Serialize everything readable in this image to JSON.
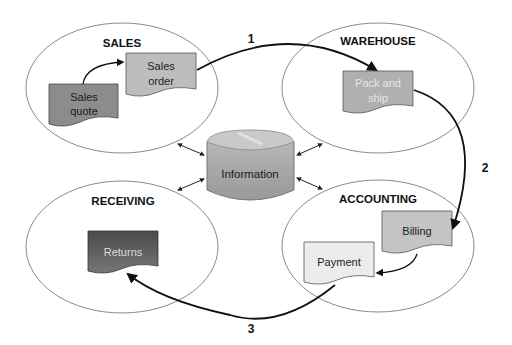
{
  "diagram": {
    "departments": [
      {
        "id": "sales",
        "label": "SALES"
      },
      {
        "id": "warehouse",
        "label": "WAREHOUSE"
      },
      {
        "id": "receiving",
        "label": "RECEIVING"
      },
      {
        "id": "accounting",
        "label": "ACCOUNTING"
      }
    ],
    "center": {
      "label": "Information",
      "icon": "database-cylinder-icon"
    },
    "documents": [
      {
        "id": "sales-quote",
        "line1": "Sales",
        "line2": "quote",
        "department": "sales",
        "fill": "#8c8c8c",
        "text_color": "#1a1a1a"
      },
      {
        "id": "sales-order",
        "line1": "Sales",
        "line2": "order",
        "department": "sales",
        "fill": "#bdbdbd",
        "text_color": "#222222"
      },
      {
        "id": "pack-and-ship",
        "line1": "Pack and",
        "line2": "ship",
        "department": "warehouse",
        "fill": "#b0b0b0",
        "text_color": "#e6e6e6"
      },
      {
        "id": "returns",
        "line1": "Returns",
        "department": "receiving",
        "fill": "#5e5e5e",
        "text_color": "#dddddd"
      },
      {
        "id": "billing",
        "line1": "Billing",
        "department": "accounting",
        "fill": "#c4c4c4",
        "text_color": "#222222"
      },
      {
        "id": "payment",
        "line1": "Payment",
        "department": "accounting",
        "fill": "#ececec",
        "text_color": "#222222"
      }
    ],
    "steps": [
      {
        "number": "1",
        "from": "Sales order",
        "to": "Pack and ship"
      },
      {
        "number": "2",
        "from": "Pack and ship",
        "to": "Billing"
      },
      {
        "number": "3",
        "from": "Payment",
        "to": "Returns"
      }
    ]
  }
}
